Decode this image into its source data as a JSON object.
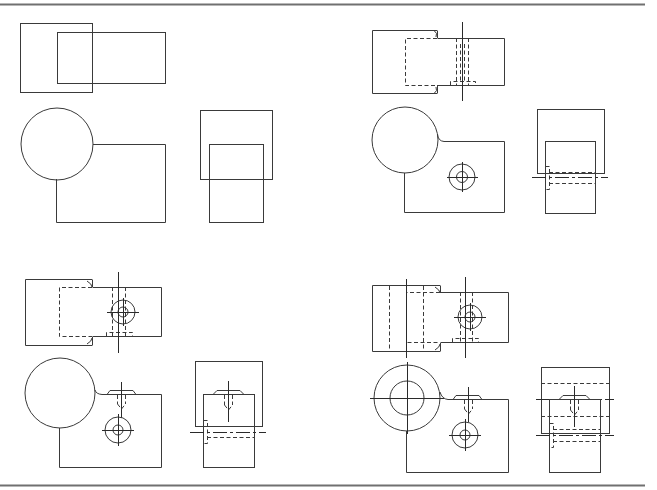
{
  "figure": {
    "type": "orthographic-projection-exercise",
    "line_color": "#3a3a3a",
    "border_color": "#707070",
    "panels": [
      {
        "id": "panel-1",
        "label": "stage 1: basic outlines",
        "views": [
          "top",
          "front",
          "side"
        ]
      },
      {
        "id": "panel-2",
        "label": "stage 2: notch, slot and bolt hole added",
        "views": [
          "top",
          "front",
          "side"
        ]
      },
      {
        "id": "panel-3",
        "label": "stage 3: counterbored top hole and side bolt added",
        "views": [
          "top",
          "front",
          "side"
        ]
      },
      {
        "id": "panel-4",
        "label": "stage 4: bore through boss added",
        "views": [
          "top",
          "front",
          "side"
        ]
      }
    ]
  }
}
